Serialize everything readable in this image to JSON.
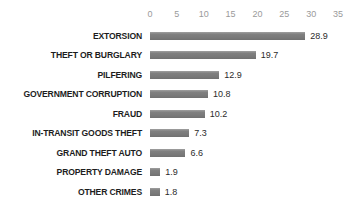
{
  "chart_data": {
    "type": "bar",
    "orientation": "horizontal",
    "title": "",
    "subtitle": "",
    "xlabel": "",
    "ylabel": "",
    "xlim": [
      0,
      35
    ],
    "grid": false,
    "legend": null,
    "bar_color": "#808080",
    "axis_tick_color": "#9a9a9a",
    "label_color": "#1d1d1d",
    "value_color": "#2b2b2b",
    "background": "#ffffff",
    "xticks": [
      0,
      5,
      10,
      15,
      20,
      25,
      30,
      35
    ],
    "xtick_labels": [
      "0",
      "5",
      "10",
      "15",
      "20",
      "25",
      "30",
      "35"
    ],
    "categories": [
      "EXTORSION",
      "THEFT OR BURGLARY",
      "PILFERING",
      "GOVERNMENT CORRUPTION",
      "FRAUD",
      "IN-TRANSIT GOODS THEFT",
      "GRAND THEFT AUTO",
      "PROPERTY DAMAGE",
      "OTHER CRIMES"
    ],
    "values": [
      28.9,
      19.7,
      12.9,
      10.8,
      10.2,
      7.3,
      6.6,
      1.9,
      1.8
    ],
    "value_labels": [
      "28.9",
      "19.7",
      "12.9",
      "10.8",
      "10.2",
      "7.3",
      "6.6",
      "1.9",
      "1.8"
    ]
  }
}
